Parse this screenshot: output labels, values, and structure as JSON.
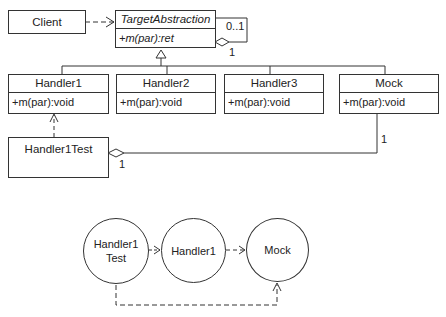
{
  "class_diagram": {
    "client": {
      "name": "Client"
    },
    "target_abstraction": {
      "name": "TargetAbstraction",
      "operation": "+m(par):ret",
      "self_assoc_multiplicity_top": "0..1",
      "self_assoc_multiplicity_bottom": "1"
    },
    "handlers": [
      {
        "name": "Handler1",
        "operation": "+m(par):void"
      },
      {
        "name": "Handler2",
        "operation": "+m(par):void"
      },
      {
        "name": "Handler3",
        "operation": "+m(par):void"
      },
      {
        "name": "Mock",
        "operation": "+m(par):void"
      }
    ],
    "test": {
      "name": "Handler1Test",
      "aggregation_multiplicity": "1",
      "mock_multiplicity": "1"
    }
  },
  "dependency_diagram": {
    "nodes": [
      {
        "line1": "Handler1",
        "line2": "Test"
      },
      {
        "line1": "Handler1"
      },
      {
        "line1": "Mock"
      }
    ]
  }
}
